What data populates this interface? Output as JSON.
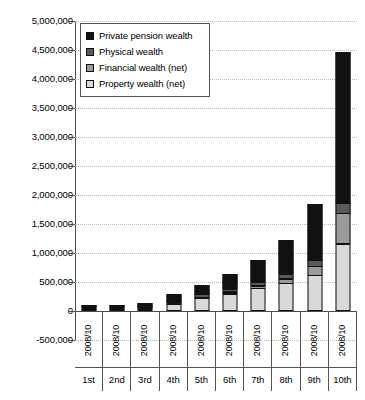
{
  "chart_data": {
    "type": "bar",
    "stacked": true,
    "title": "",
    "xlabel": "",
    "ylabel": "",
    "ylim": [
      -500000,
      5000000
    ],
    "ytick_step": 500000,
    "ytick_labels": [
      "5,000,000",
      "4,500,000",
      "4,000,000",
      "3,500,000",
      "3,000,000",
      "2,500,000",
      "2,000,000",
      "1,500,000",
      "1,000,000",
      "500,000",
      "0",
      "-500,000"
    ],
    "ytick_values": [
      5000000,
      4500000,
      4000000,
      3500000,
      3000000,
      2500000,
      2000000,
      1500000,
      1000000,
      500000,
      0,
      -500000
    ],
    "grid": true,
    "legend_position": "top-left",
    "categories": [
      "1st",
      "2nd",
      "3rd",
      "4th",
      "5th",
      "6th",
      "7th",
      "8th",
      "9th",
      "10th"
    ],
    "period_labels": [
      "2008/10",
      "2008/10",
      "2008/10",
      "2008/10",
      "2008/10",
      "2008/10",
      "2008/10",
      "2008/10",
      "2008/10",
      "2008/10"
    ],
    "series": [
      {
        "name": "Property wealth (net)",
        "color": "#d9d9d9",
        "values": [
          1000,
          4000,
          40000,
          120000,
          220000,
          300000,
          390000,
          480000,
          620000,
          1160000
        ]
      },
      {
        "name": "Financial wealth (net)",
        "color": "#9a9a9a",
        "values": [
          2000,
          4000,
          15000,
          30000,
          35000,
          45000,
          60000,
          90000,
          160000,
          540000
        ]
      },
      {
        "name": "Physical wealth",
        "color": "#5a5a5a",
        "values": [
          7000,
          14000,
          35000,
          45000,
          55000,
          65000,
          80000,
          100000,
          120000,
          180000
        ]
      },
      {
        "name": "Private pension wealth",
        "color": "#111111",
        "values": [
          3000,
          23000,
          60000,
          125000,
          175000,
          270000,
          390000,
          590000,
          980000,
          2620000
        ]
      }
    ],
    "totals": [
      13000,
      45000,
      150000,
      320000,
      485000,
      680000,
      920000,
      1260000,
      1880000,
      4500000
    ]
  },
  "legend": {
    "items": [
      {
        "label": "Private pension wealth",
        "color": "#111111",
        "swatch": "legend-swatch-pension"
      },
      {
        "label": "Physical wealth",
        "color": "#5a5a5a",
        "swatch": "legend-swatch-physical"
      },
      {
        "label": "Financial wealth (net)",
        "color": "#9a9a9a",
        "swatch": "legend-swatch-financial"
      },
      {
        "label": "Property wealth (net)",
        "color": "#d9d9d9",
        "swatch": "legend-swatch-property"
      }
    ]
  }
}
